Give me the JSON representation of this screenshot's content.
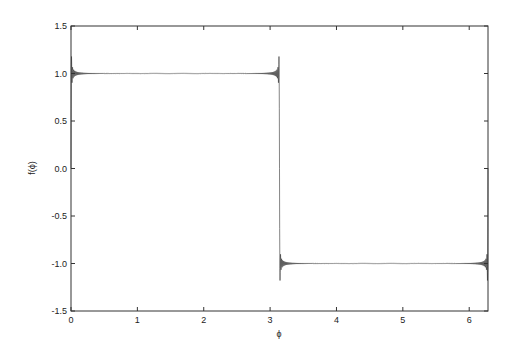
{
  "chart_data": {
    "type": "line",
    "title": "",
    "xlabel": "ϕ",
    "ylabel": "f(ϕ)",
    "xlim": [
      0,
      6.2832
    ],
    "ylim": [
      -1.5,
      1.5
    ],
    "grid": false,
    "legend": null,
    "x_ticks": [
      0,
      1,
      2,
      3,
      4,
      5,
      6
    ],
    "x_tick_labels": [
      "0",
      "1",
      "2",
      "3",
      "4",
      "5",
      "6"
    ],
    "y_ticks": [
      1.5,
      1.0,
      0.5,
      0.0,
      -0.5,
      -1.0,
      -1.5
    ],
    "y_tick_labels": [
      "1.5",
      "1.0",
      "0.5",
      "0.0",
      "-0.5",
      "-1.0",
      "-1.5"
    ],
    "series": [
      {
        "name": "Fourier series of square wave",
        "description": "Square wave +1 on (0, π), -1 on (π, 2π) with Gibbs overshoot ≈ ±1.18 at discontinuities",
        "x": [
          0,
          0.02,
          0.1,
          0.5,
          1.0,
          2.0,
          3.0,
          3.12,
          3.1416,
          3.16,
          3.3,
          4.0,
          5.0,
          6.0,
          6.26,
          6.2832
        ],
        "y": [
          0,
          1.18,
          1.02,
          1.0,
          1.0,
          1.0,
          1.0,
          1.18,
          0,
          -1.18,
          -1.02,
          -1.0,
          -1.0,
          -1.0,
          -1.18,
          0
        ]
      }
    ],
    "line_color": "#333333"
  }
}
